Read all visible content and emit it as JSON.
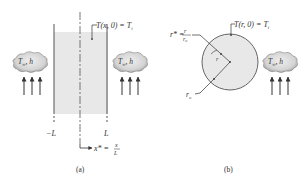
{
  "figure": {
    "panel_a": {
      "caption": "(a)",
      "plane_wall": {
        "fill_color": "#e6e6e6",
        "initial_condition": {
          "lhs": "T(x, 0) = T",
          "subscript": "i"
        },
        "left_face_label": "−L",
        "right_face_label": "L",
        "coordinate": {
          "lhs": "x* =",
          "numerator": "x",
          "denominator": "L"
        }
      },
      "left_fluid": {
        "label_T": "T",
        "label_sub": "∞",
        "label_h": ", h",
        "arrows": 3
      },
      "right_fluid": {
        "label_T": "T",
        "label_sub": "∞",
        "label_h": ", h",
        "arrows": 3
      }
    },
    "panel_b": {
      "caption": "(b)",
      "cylinder": {
        "fill_color": "#e6e6e6",
        "initial_condition": {
          "lhs": "T(r, 0) = T",
          "subscript": "i"
        },
        "radius_var": "r",
        "outer_radius": {
          "base": "r",
          "sub": "o"
        },
        "coordinate": {
          "lhs": "r* =",
          "numerator": "r",
          "denominator_base": "r",
          "denominator_sub": "o"
        }
      },
      "fluid": {
        "label_T": "T",
        "label_sub": "∞",
        "label_h": ", h",
        "arrows": 3
      }
    },
    "colors": {
      "line": "#555555",
      "cloud_fill": "#dcdcdc",
      "cloud_stroke": "#666666",
      "text": "#333333"
    }
  }
}
